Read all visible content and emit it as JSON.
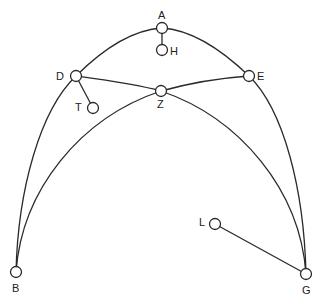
{
  "diagram": {
    "type": "astronomical-geometric-figure",
    "stroke_color": "#2a2a2a",
    "background": "#ffffff",
    "nodes": [
      {
        "id": "A",
        "label": "A",
        "x": 162,
        "y": 28
      },
      {
        "id": "H",
        "label": "H",
        "x": 162,
        "y": 50
      },
      {
        "id": "D",
        "label": "D",
        "x": 76,
        "y": 76
      },
      {
        "id": "T",
        "label": "T",
        "x": 93,
        "y": 108
      },
      {
        "id": "Z",
        "label": "Z",
        "x": 161,
        "y": 91
      },
      {
        "id": "E",
        "label": "E",
        "x": 249,
        "y": 76
      },
      {
        "id": "B",
        "label": "B",
        "x": 16,
        "y": 272
      },
      {
        "id": "G",
        "label": "G",
        "x": 306,
        "y": 274
      },
      {
        "id": "L",
        "label": "L",
        "x": 215,
        "y": 224
      }
    ],
    "edges": [
      {
        "from": "B",
        "to": "G",
        "via": [
          "D",
          "A",
          "E"
        ],
        "kind": "outer-arc"
      },
      {
        "from": "D",
        "to": "G",
        "via": [
          "Z"
        ],
        "kind": "inner-arc"
      },
      {
        "from": "E",
        "to": "B",
        "via": [
          "Z"
        ],
        "kind": "inner-arc"
      },
      {
        "from": "A",
        "to": "H",
        "kind": "straight"
      },
      {
        "from": "D",
        "to": "T",
        "kind": "straight"
      },
      {
        "from": "L",
        "to": "G",
        "kind": "straight"
      }
    ]
  },
  "labels": {
    "A": "A",
    "H": "H",
    "D": "D",
    "T": "T",
    "Z": "Z",
    "E": "E",
    "B": "B",
    "G": "G",
    "L": "L"
  }
}
